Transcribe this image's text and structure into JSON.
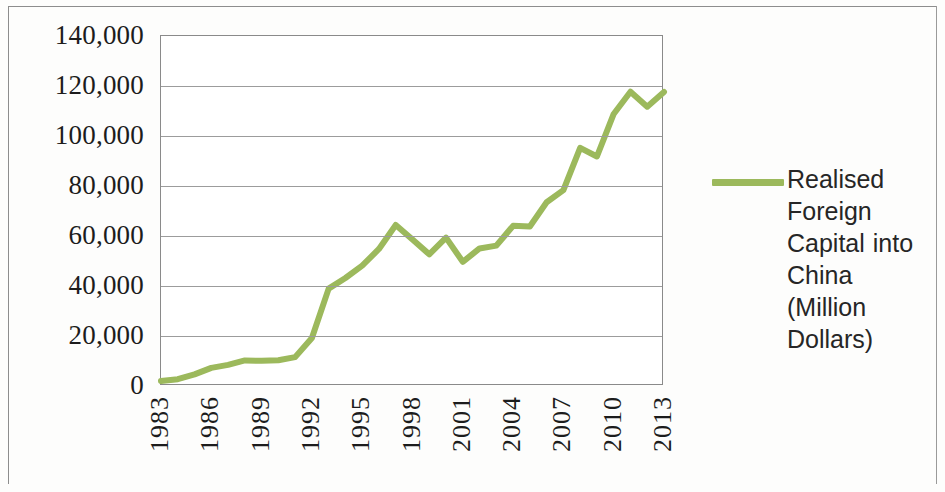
{
  "figure": {
    "kind": "line-chart",
    "background_color": "#ffffff",
    "border_color": "#8a8a8a"
  },
  "legend": {
    "position": "right",
    "swatch_icon": "line-swatch-icon",
    "label": "Realised Foreign Capital into China (Million Dollars)",
    "color": "#9cb95c"
  },
  "chart_data": {
    "type": "line",
    "title": "",
    "subtitle": "",
    "xlabel": "",
    "ylabel": "",
    "grid": true,
    "legend_position": "right",
    "series_color": "#9cb95c",
    "xlim": [
      1983,
      2013
    ],
    "ylim": [
      0,
      140000
    ],
    "y_ticks": [
      0,
      20000,
      40000,
      60000,
      80000,
      100000,
      120000,
      140000
    ],
    "y_tick_labels": [
      "0",
      "20,000",
      "40,000",
      "60,000",
      "80,000",
      "100,000",
      "120,000",
      "140,000"
    ],
    "x_ticks": [
      1983,
      1986,
      1989,
      1992,
      1995,
      1998,
      2001,
      2004,
      2007,
      2010,
      2013
    ],
    "x_tick_labels": [
      "1983",
      "1986",
      "1989",
      "1992",
      "1995",
      "1998",
      "2001",
      "2004",
      "2007",
      "2010",
      "2013"
    ],
    "x": [
      1983,
      1984,
      1985,
      1986,
      1987,
      1988,
      1989,
      1990,
      1991,
      1992,
      1993,
      1994,
      1995,
      1996,
      1997,
      1998,
      1999,
      2000,
      2001,
      2002,
      2003,
      2004,
      2005,
      2006,
      2007,
      2008,
      2009,
      2010,
      2011,
      2012,
      2013
    ],
    "series": [
      {
        "name": "Realised Foreign Capital into China (Million Dollars)",
        "values": [
          1981,
          2705,
          4646,
          7258,
          8452,
          10226,
          10060,
          10289,
          11554,
          19202,
          38960,
          43213,
          48133,
          54804,
          64408,
          58557,
          52659,
          59356,
          49672,
          55011,
          56140,
          64072,
          63805,
          73500,
          78339,
          95253,
          91804,
          108821,
          117709,
          111716,
          117586
        ]
      }
    ]
  }
}
